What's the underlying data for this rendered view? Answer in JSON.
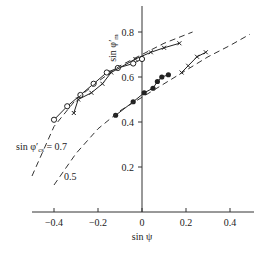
{
  "chart_data": {
    "type": "line",
    "title": "",
    "xlabel": "sin ψ",
    "ylabel": "sin φ'm",
    "xlim": [
      -0.5,
      0.5
    ],
    "ylim": [
      0,
      0.9
    ],
    "grid": false,
    "x_ticks": [
      "-0.4",
      "-0.2",
      "0",
      "0.2",
      "0.4"
    ],
    "y_ticks": [
      "0.2",
      "0.4",
      "0.6",
      "0.8"
    ],
    "annotations": [
      {
        "text": "sin φ'cs = 0.7",
        "target": "upper dashed curve"
      },
      {
        "text": "0.5",
        "target": "lower dashed curve"
      }
    ],
    "series": [
      {
        "name": "open circles",
        "marker": "open-circle",
        "points": [
          [
            -0.4,
            0.41
          ],
          [
            -0.34,
            0.47
          ],
          [
            -0.28,
            0.52
          ],
          [
            -0.22,
            0.57
          ],
          [
            -0.16,
            0.62
          ],
          [
            -0.11,
            0.64
          ],
          [
            -0.04,
            0.66
          ],
          [
            0.0,
            0.68
          ]
        ]
      },
      {
        "name": "crosses (left)",
        "marker": "cross",
        "points": [
          [
            -0.31,
            0.44
          ],
          [
            -0.29,
            0.5
          ],
          [
            -0.23,
            0.53
          ],
          [
            -0.18,
            0.57
          ],
          [
            -0.14,
            0.62
          ],
          [
            -0.03,
            0.68
          ],
          [
            0.04,
            0.71
          ],
          [
            0.1,
            0.73
          ],
          [
            0.17,
            0.75
          ]
        ]
      },
      {
        "name": "filled circles",
        "marker": "filled-circle",
        "points": [
          [
            -0.12,
            0.43
          ],
          [
            -0.04,
            0.49
          ],
          [
            0.01,
            0.53
          ],
          [
            0.05,
            0.55
          ],
          [
            0.07,
            0.58
          ],
          [
            0.09,
            0.6
          ],
          [
            0.12,
            0.61
          ]
        ]
      },
      {
        "name": "crosses (right)",
        "marker": "cross",
        "points": [
          [
            0.18,
            0.62
          ],
          [
            0.21,
            0.65
          ],
          [
            0.25,
            0.69
          ],
          [
            0.29,
            0.71
          ]
        ]
      },
      {
        "name": "sin φ'cs = 0.7",
        "style": "dashed",
        "points": [
          [
            -0.5,
            0.16
          ],
          [
            -0.4,
            0.38
          ],
          [
            -0.3,
            0.5
          ],
          [
            -0.2,
            0.58
          ],
          [
            -0.1,
            0.65
          ],
          [
            0.0,
            0.7
          ],
          [
            0.1,
            0.75
          ],
          [
            0.23,
            0.8
          ]
        ]
      },
      {
        "name": "0.5",
        "style": "dashed",
        "points": [
          [
            -0.4,
            0.12
          ],
          [
            -0.3,
            0.26
          ],
          [
            -0.2,
            0.37
          ],
          [
            -0.1,
            0.45
          ],
          [
            0.0,
            0.51
          ],
          [
            0.1,
            0.57
          ],
          [
            0.2,
            0.63
          ],
          [
            0.3,
            0.69
          ],
          [
            0.4,
            0.74
          ],
          [
            0.49,
            0.79
          ]
        ]
      }
    ]
  }
}
